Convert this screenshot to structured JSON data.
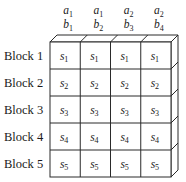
{
  "diagram": {
    "columns": [
      {
        "a": {
          "base": "a",
          "sub": "1"
        },
        "b": {
          "base": "b",
          "sub": "1"
        }
      },
      {
        "a": {
          "base": "a",
          "sub": "1"
        },
        "b": {
          "base": "b",
          "sub": "2"
        }
      },
      {
        "a": {
          "base": "a",
          "sub": "2"
        },
        "b": {
          "base": "b",
          "sub": "3"
        }
      },
      {
        "a": {
          "base": "a",
          "sub": "2"
        },
        "b": {
          "base": "b",
          "sub": "4"
        }
      }
    ],
    "rows": [
      {
        "label": "Block 1",
        "cells": [
          {
            "base": "s",
            "sub": "1"
          },
          {
            "base": "s",
            "sub": "1"
          },
          {
            "base": "s",
            "sub": "1"
          },
          {
            "base": "s",
            "sub": "1"
          }
        ]
      },
      {
        "label": "Block 2",
        "cells": [
          {
            "base": "s",
            "sub": "2"
          },
          {
            "base": "s",
            "sub": "2"
          },
          {
            "base": "s",
            "sub": "2"
          },
          {
            "base": "s",
            "sub": "2"
          }
        ]
      },
      {
        "label": "Block 3",
        "cells": [
          {
            "base": "s",
            "sub": "3"
          },
          {
            "base": "s",
            "sub": "3"
          },
          {
            "base": "s",
            "sub": "3"
          },
          {
            "base": "s",
            "sub": "3"
          }
        ]
      },
      {
        "label": "Block 4",
        "cells": [
          {
            "base": "s",
            "sub": "4"
          },
          {
            "base": "s",
            "sub": "4"
          },
          {
            "base": "s",
            "sub": "4"
          },
          {
            "base": "s",
            "sub": "4"
          }
        ]
      },
      {
        "label": "Block 5",
        "cells": [
          {
            "base": "s",
            "sub": "5"
          },
          {
            "base": "s",
            "sub": "5"
          },
          {
            "base": "s",
            "sub": "5"
          },
          {
            "base": "s",
            "sub": "5"
          }
        ]
      }
    ]
  }
}
